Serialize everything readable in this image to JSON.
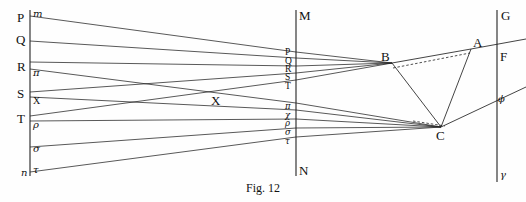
{
  "figure": {
    "caption": "Fig. 12",
    "ink_color": "#222222",
    "background_color": "#fefefe"
  },
  "left_axis": {
    "name": "object-plane",
    "x": 30,
    "y_top": 10,
    "y_bottom": 176,
    "labels": [
      {
        "id": "P",
        "text": "P",
        "style": "roman",
        "x": 17,
        "y": 11
      },
      {
        "id": "m",
        "text": "m",
        "style": "greek",
        "x": 33,
        "y": 9
      },
      {
        "id": "Q",
        "text": "Q",
        "style": "roman",
        "x": 16,
        "y": 33
      },
      {
        "id": "R",
        "text": "R",
        "style": "roman",
        "x": 17,
        "y": 60
      },
      {
        "id": "pi",
        "text": "π",
        "style": "greek",
        "x": 33,
        "y": 68
      },
      {
        "id": "S",
        "text": "S",
        "style": "roman",
        "x": 17,
        "y": 87
      },
      {
        "id": "X",
        "text": "X",
        "style": "small-roman",
        "x": 33,
        "y": 96
      },
      {
        "id": "T",
        "text": "T",
        "style": "roman",
        "x": 17,
        "y": 112
      },
      {
        "id": "rho",
        "text": "ρ",
        "style": "greek",
        "x": 33,
        "y": 120
      },
      {
        "id": "sigma",
        "text": "σ",
        "style": "greek",
        "x": 33,
        "y": 144
      },
      {
        "id": "n",
        "text": "n",
        "style": "greek",
        "x": 21,
        "y": 168
      },
      {
        "id": "tau",
        "text": "τ",
        "style": "greek",
        "x": 33,
        "y": 165
      }
    ]
  },
  "mid_axis": {
    "name": "lens-plane",
    "x": 296,
    "y_top": 10,
    "y_bottom": 176,
    "top_label": {
      "text": "M",
      "x": 299,
      "y": 9
    },
    "bottom_label": {
      "text": "N",
      "x": 299,
      "y": 164
    },
    "labels": [
      {
        "id": "P2",
        "text": "P",
        "style": "mid",
        "x": 285,
        "y": 48
      },
      {
        "id": "Q2",
        "text": "Q",
        "style": "mid",
        "x": 285,
        "y": 57
      },
      {
        "id": "R2",
        "text": "R",
        "style": "mid",
        "x": 285,
        "y": 65
      },
      {
        "id": "S2",
        "text": "S",
        "style": "mid",
        "x": 285,
        "y": 73
      },
      {
        "id": "T2",
        "text": "T",
        "style": "mid",
        "x": 285,
        "y": 82
      },
      {
        "id": "pi2",
        "text": "π",
        "style": "mid-greek",
        "x": 285,
        "y": 102
      },
      {
        "id": "chi2",
        "text": "χ",
        "style": "mid-greek",
        "x": 285,
        "y": 111
      },
      {
        "id": "rho2",
        "text": "ρ",
        "style": "mid-greek",
        "x": 285,
        "y": 119
      },
      {
        "id": "sig2",
        "text": "σ",
        "style": "mid-greek",
        "x": 285,
        "y": 128
      },
      {
        "id": "tau2",
        "text": "τ",
        "style": "mid-greek",
        "x": 285,
        "y": 137
      }
    ]
  },
  "right_axis": {
    "name": "image-plane",
    "x": 497,
    "y_top": 10,
    "y_bottom": 182,
    "labels": [
      {
        "id": "G",
        "text": "G",
        "style": "roman",
        "x": 501,
        "y": 9
      },
      {
        "id": "F",
        "text": "F",
        "style": "roman",
        "x": 500,
        "y": 50
      },
      {
        "id": "phi",
        "text": "ϕ",
        "style": "greek",
        "x": 498,
        "y": 94
      },
      {
        "id": "gamma",
        "text": "γ",
        "style": "greek",
        "x": 500,
        "y": 170
      }
    ]
  },
  "vertex_labels": [
    {
      "id": "A",
      "text": "A",
      "style": "roman",
      "x": 473,
      "y": 36
    },
    {
      "id": "B",
      "text": "B",
      "style": "roman",
      "x": 381,
      "y": 50
    },
    {
      "id": "C",
      "text": "C",
      "style": "roman",
      "x": 436,
      "y": 129
    }
  ],
  "field_label": {
    "id": "X-field",
    "text": "X",
    "style": "roman",
    "x": 211,
    "y": 94
  },
  "points": {
    "B": {
      "x": 392,
      "y": 63
    },
    "A": {
      "x": 471,
      "y": 49
    },
    "C": {
      "x": 441,
      "y": 127
    },
    "F_on_axis": {
      "x": 497,
      "y": 57
    },
    "phi_on_axis": {
      "x": 497,
      "y": 103
    }
  },
  "upper_fan": {
    "name": "upper-ray-bundle",
    "converge_to": {
      "x": 392,
      "y": 63
    },
    "rays": [
      {
        "id": "ray-P",
        "x1": 30,
        "y1": 16,
        "mid_y": 52
      },
      {
        "id": "ray-Q",
        "x1": 30,
        "y1": 41,
        "mid_y": 58
      },
      {
        "id": "ray-R",
        "x1": 30,
        "y1": 62,
        "mid_y": 66
      },
      {
        "id": "ray-S",
        "x1": 30,
        "y1": 92,
        "mid_y": 73
      },
      {
        "id": "ray-T",
        "x1": 30,
        "y1": 116,
        "mid_y": 80
      }
    ]
  },
  "lower_fan": {
    "name": "lower-ray-bundle",
    "converge_to": {
      "x": 441,
      "y": 127
    },
    "rays": [
      {
        "id": "ray-pi",
        "x1": 30,
        "y1": 69,
        "mid_y": 103
      },
      {
        "id": "ray-chi",
        "x1": 30,
        "y1": 97,
        "mid_y": 110
      },
      {
        "id": "ray-rho",
        "x1": 30,
        "y1": 121,
        "mid_y": 119
      },
      {
        "id": "ray-sigma",
        "x1": 30,
        "y1": 147,
        "mid_y": 128
      },
      {
        "id": "ray-tau",
        "x1": 30,
        "y1": 172,
        "mid_y": 137
      }
    ]
  },
  "exit_rays": [
    {
      "id": "exit-B-to-A",
      "x1": 392,
      "y1": 63,
      "x2": 471,
      "y2": 49
    },
    {
      "id": "exit-A-to-G",
      "x1": 471,
      "y1": 49,
      "x2": 526,
      "y2": 39
    },
    {
      "id": "exit-B-to-C",
      "x1": 392,
      "y1": 63,
      "x2": 441,
      "y2": 127
    },
    {
      "id": "exit-A-to-C",
      "x1": 471,
      "y1": 49,
      "x2": 441,
      "y2": 127
    },
    {
      "id": "exit-C-to-F",
      "x1": 441,
      "y1": 127,
      "x2": 526,
      "y2": 87
    }
  ],
  "dashed_ray": {
    "id": "chord-B-to-A",
    "x1": 393,
    "y1": 68,
    "x2": 470,
    "y2": 53
  },
  "dashed_ray_lower": {
    "id": "chord-C-left",
    "x1": 413,
    "y1": 121,
    "x2": 445,
    "y2": 126
  }
}
